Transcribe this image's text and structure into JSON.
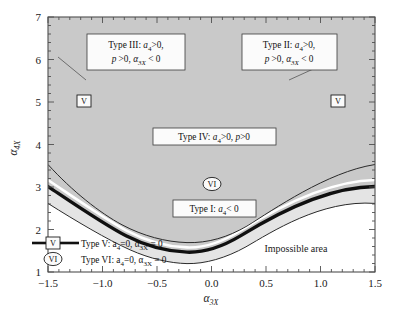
{
  "figure": {
    "background_color": "#ffffff",
    "frame_color": "#4a4a4a"
  },
  "chart_data": {
    "type": "line",
    "title": "",
    "xlabel": "α₃ₓ",
    "ylabel": "α₄ₓ",
    "xlim": [
      -1.5,
      1.5
    ],
    "ylim": [
      1,
      7
    ],
    "grid": false,
    "legend_position": "bottom-left",
    "xticks": [
      "-1.5",
      "-1.0",
      "-0.5",
      "0.0",
      "0.5",
      "1.0",
      "1.5"
    ],
    "xtick_values": [
      -1.5,
      -1.0,
      -0.5,
      0.0,
      0.5,
      1.0,
      1.5
    ],
    "yticks": [
      "1",
      "2",
      "3",
      "4",
      "5",
      "6",
      "7"
    ],
    "ytick_values": [
      1,
      2,
      3,
      4,
      5,
      6,
      7
    ],
    "x_minor_tick_step": 0.1,
    "y_minor_tick_step": 0.2,
    "series": [
      {
        "name": "upper-boundary-curve",
        "style": "thin-solid",
        "description": "upper thin parabola, Type III / Type II outer boundary",
        "x": [
          -1.5,
          -1.25,
          -1.0,
          -0.75,
          -0.5,
          -0.25,
          0.0,
          0.25,
          0.5,
          0.75,
          1.0,
          1.25,
          1.5
        ],
        "y": [
          6.52,
          5.85,
          5.2,
          4.6,
          4.08,
          3.66,
          3.35,
          3.2,
          3.25,
          3.55,
          4.1,
          5.0,
          6.52
        ]
      },
      {
        "name": "type-v-thick-curve",
        "style": "thick-solid-black",
        "description": "thick black Type V boundary curve with minimum at (0, 3)",
        "x": [
          -1.5,
          -1.25,
          -1.0,
          -0.75,
          -0.5,
          -0.25,
          0.0,
          0.25,
          0.5,
          0.75,
          1.0,
          1.25,
          1.5
        ],
        "y": [
          6.0,
          5.4,
          4.82,
          4.3,
          3.84,
          3.44,
          3.1,
          3.0,
          3.15,
          3.6,
          4.35,
          5.15,
          6.0
        ]
      },
      {
        "name": "lower-boundary-curve",
        "style": "thin-solid",
        "description": "lower thin parabola separating Type I from Impossible area",
        "x": [
          -1.5,
          -1.25,
          -1.0,
          -0.75,
          -0.5,
          -0.25,
          0.0,
          0.25,
          0.5,
          0.75,
          1.0,
          1.25,
          1.5
        ],
        "y": [
          5.38,
          4.72,
          4.12,
          3.56,
          3.04,
          2.56,
          2.12,
          1.92,
          2.0,
          2.45,
          3.3,
          4.3,
          5.38
        ]
      }
    ],
    "regions": [
      {
        "name": "type-iv-region",
        "label": "Type IV",
        "fill": "#c9c9c9",
        "description": "dark gray region above the thick curve"
      },
      {
        "name": "type-i-region",
        "label": "Type I",
        "fill": "#e3e3e3",
        "description": "light gray band between thick curve and lower thin curve"
      },
      {
        "name": "impossible-region",
        "label": "Impossible area",
        "fill": "#ffffff",
        "description": "white region below the lower thin curve"
      }
    ],
    "annotations": [
      {
        "name": "type-iii-annotation",
        "line1": "Type III: a",
        "sub1": "4",
        "line1b": ">0,",
        "line2a": "p",
        "line2b": ">0, ",
        "sub2": "3X",
        "line2c": "< 0",
        "text": "Type III: a4>0, p >0, α3X < 0",
        "x": -1.02,
        "y": 6.05
      },
      {
        "name": "type-ii-annotation",
        "text": "Type II: a4>0, p >0, α3X < 0",
        "x": 0.92,
        "y": 6.05
      },
      {
        "name": "type-iv-annotation",
        "text": "Type IV: a4>0, p>0",
        "x": 0.05,
        "y": 4.35
      },
      {
        "name": "type-i-annotation",
        "text": "Type I: a4< 0",
        "x": 0.1,
        "y": 2.5
      },
      {
        "name": "impossible-area-annotation",
        "text": "Impossible area",
        "x": 0.95,
        "y": 1.55
      }
    ],
    "markers": [
      {
        "name": "marker-v-left",
        "label": "V",
        "shape": "box",
        "x": -1.21,
        "y": 5.0
      },
      {
        "name": "marker-v-right",
        "label": "V",
        "shape": "box",
        "x": 1.23,
        "y": 5.0
      },
      {
        "name": "marker-vi-center",
        "label": "VI",
        "shape": "ellipse",
        "x": 0.02,
        "y": 3.02
      }
    ]
  },
  "labels": {
    "type_iii": {
      "prefix": "Type III: ",
      "a": "a",
      "a_sub": "4",
      "gt0": ">0,",
      "p": "p",
      "p_gt0": " >0, ",
      "alpha": "α",
      "alpha_sub": "3X",
      "lt0": " < 0"
    },
    "type_ii": {
      "prefix": "Type II: ",
      "a": "a",
      "a_sub": "4",
      "gt0": ">0,",
      "p": "p",
      "p_gt0": " >0, ",
      "alpha": "α",
      "alpha_sub": "3X",
      "lt0": " < 0"
    },
    "type_iv": {
      "prefix": "Type IV: ",
      "a": "a",
      "a_sub": "4",
      "gt0": ">0, ",
      "p": "p",
      "p_gt0": ">0"
    },
    "type_i": {
      "prefix": "Type I: ",
      "a": "a",
      "a_sub": "4",
      "lt0": "< 0"
    },
    "impossible_area": "Impossible area"
  },
  "legend": {
    "items": [
      {
        "marker_label": "V",
        "marker_shape": "box-with-line",
        "prefix": "Type V: ",
        "a": "a",
        "a_sub": "4",
        "eq0": "=0, ",
        "alpha": "α",
        "alpha_sub": "3X",
        "eq0b": " = 0"
      },
      {
        "marker_label": "VI",
        "marker_shape": "ellipse",
        "prefix": "Type VI: ",
        "a": "a",
        "a_sub": "4",
        "eq0": "=0, ",
        "alpha": "α",
        "alpha_sub": "3X",
        "eq0b": " = 0"
      }
    ]
  },
  "axes": {
    "x_title_base": "α",
    "x_title_sub": "3X",
    "y_title_base": "α",
    "y_title_sub": "4X"
  }
}
